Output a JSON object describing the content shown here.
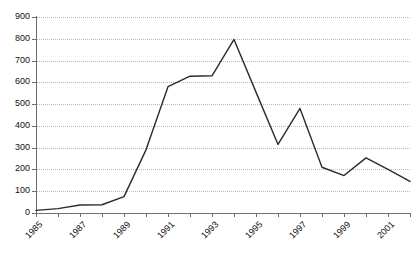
{
  "chart_data": {
    "type": "line",
    "title": "",
    "subtitle": "",
    "xlabel": "",
    "ylabel": "",
    "xlim": [
      1985,
      2002
    ],
    "ylim": [
      0,
      900
    ],
    "grid": true,
    "grid_style": "dotted horizontal",
    "legend": false,
    "legend_position": "none",
    "x": [
      1985,
      1986,
      1987,
      1988,
      1989,
      1990,
      1991,
      1992,
      1993,
      1994,
      1995,
      1996,
      1997,
      1998,
      1999,
      2000,
      2001,
      2002
    ],
    "values": [
      12,
      20,
      37,
      38,
      75,
      290,
      580,
      628,
      630,
      797,
      555,
      315,
      480,
      210,
      172,
      253,
      200,
      145
    ],
    "categories": [
      "1985",
      "1986",
      "1987",
      "1988",
      "1989",
      "1990",
      "1991",
      "1992",
      "1993",
      "1994",
      "1995",
      "1996",
      "1997",
      "1998",
      "1999",
      "2000",
      "2001",
      "2002"
    ],
    "series": [
      {
        "name": "series-1",
        "color": "#2b2b2b",
        "values": [
          12,
          20,
          37,
          38,
          75,
          290,
          580,
          628,
          630,
          797,
          555,
          315,
          480,
          210,
          172,
          253,
          200,
          145
        ]
      }
    ],
    "y_ticks": [
      0,
      100,
      200,
      300,
      400,
      500,
      600,
      700,
      800,
      900
    ],
    "y_tick_labels": [
      "0",
      "100",
      "200",
      "300",
      "400",
      "500",
      "600",
      "700",
      "800",
      "900"
    ],
    "x_ticks": [
      1985,
      1986,
      1987,
      1988,
      1989,
      1990,
      1991,
      1992,
      1993,
      1994,
      1995,
      1996,
      1997,
      1998,
      1999,
      2000,
      2001,
      2002
    ],
    "x_tick_labels": [
      "1985",
      "",
      "1987",
      "",
      "1989",
      "",
      "1991",
      "",
      "1993",
      "",
      "1995",
      "",
      "1997",
      "",
      "1999",
      "",
      "2001",
      ""
    ],
    "x_label_rotation": -45,
    "colors": {
      "line": "#2b2b2b",
      "grid": "#b9b9b9",
      "axis": "#6e6e6e",
      "text": "#111111",
      "background": "#ffffff"
    }
  }
}
